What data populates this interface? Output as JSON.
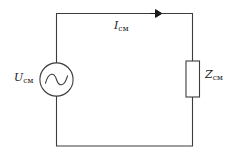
{
  "figure": {
    "name": "ac-series-circuit",
    "type": "circuit-diagram",
    "background_color": "#ffffff",
    "line_color": "#3c3c3c",
    "text_color": "#1a1a1a"
  },
  "labels": {
    "current": {
      "symbol": "I",
      "subscript": "см"
    },
    "voltage": {
      "symbol": "U",
      "subscript": "см"
    },
    "impedance": {
      "symbol": "Z",
      "subscript": "см"
    }
  },
  "components": {
    "source": {
      "icon_name": "ac-source-icon",
      "shape": "circle-with-sine-wave"
    },
    "impedance": {
      "icon_name": "impedance-block-icon",
      "shape": "rectangle"
    },
    "current_arrow": {
      "icon_name": "current-direction-arrow-icon",
      "direction": "right"
    }
  }
}
